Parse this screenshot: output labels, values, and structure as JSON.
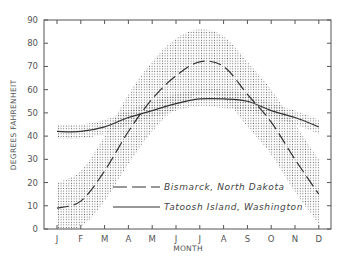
{
  "chart_data": {
    "type": "line",
    "title": "",
    "xlabel": "MONTH",
    "ylabel": "DEGREES FAHRENHEIT",
    "categories": [
      "J",
      "F",
      "M",
      "A",
      "M",
      "J",
      "J",
      "A",
      "S",
      "O",
      "N",
      "D"
    ],
    "ylim": [
      0,
      90
    ],
    "yticks": [
      0,
      10,
      20,
      30,
      40,
      50,
      60,
      70,
      80,
      90
    ],
    "ytick_labels": [
      "0",
      "10",
      "20",
      "30",
      "40",
      "50",
      "60",
      "70",
      "80",
      "90"
    ],
    "grid": false,
    "legend_position": "lower-center",
    "series": [
      {
        "name": "Bismarck, North Dakota",
        "style": "dashed",
        "values": [
          9,
          12,
          25,
          42,
          56,
          66,
          72,
          70,
          58,
          46,
          30,
          15
        ],
        "band_upper": [
          20,
          25,
          40,
          58,
          72,
          82,
          86,
          83,
          72,
          60,
          45,
          30
        ],
        "band_lower": [
          0,
          1,
          12,
          28,
          42,
          52,
          58,
          56,
          44,
          32,
          16,
          2
        ]
      },
      {
        "name": "Tatoosh Island, Washington",
        "style": "solid",
        "values": [
          42,
          42,
          44,
          48,
          51,
          54,
          56,
          56,
          55,
          51,
          48,
          44
        ],
        "band_upper": [
          45,
          45,
          47,
          51,
          55,
          58,
          60,
          60,
          58,
          54,
          51,
          47
        ],
        "band_lower": [
          39,
          39,
          41,
          45,
          48,
          51,
          53,
          52,
          51,
          48,
          45,
          41
        ]
      }
    ]
  }
}
